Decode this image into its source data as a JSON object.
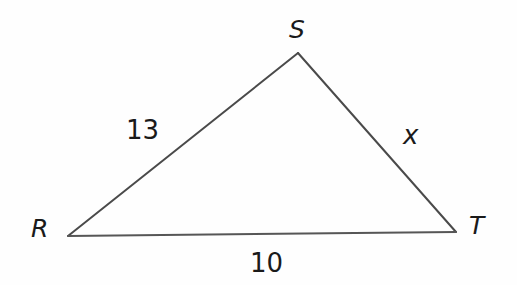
{
  "figure": {
    "kind": "geometry-diagram",
    "shape": "triangle",
    "name": "RST",
    "width": 517,
    "height": 285,
    "background_color": "#fefefe",
    "stroke_color": "#4a4a4a",
    "stroke_width": 2,
    "text_color": "#1a1a1a"
  },
  "vertices": [
    {
      "label": "R",
      "x": 68,
      "y": 236
    },
    {
      "label": "S",
      "x": 298,
      "y": 53
    },
    {
      "label": "T",
      "x": 456,
      "y": 232
    }
  ],
  "sides": [
    {
      "name": "RS",
      "label": "13",
      "from": "R",
      "to": "S",
      "known": true
    },
    {
      "name": "ST",
      "label": "x",
      "from": "S",
      "to": "T",
      "known": false
    },
    {
      "name": "RT",
      "label": "10",
      "from": "R",
      "to": "T",
      "known": true
    }
  ],
  "chart_data": {
    "type": "diagram",
    "title": "",
    "shape": "triangle",
    "vertex_labels": [
      "R",
      "S",
      "T"
    ],
    "vertex_points": [
      [
        68,
        236
      ],
      [
        298,
        53
      ],
      [
        456,
        232
      ]
    ],
    "side_labels": [
      "13",
      "x",
      "10"
    ],
    "side_label_positions": [
      [
        126,
        117
      ],
      [
        403,
        122
      ],
      [
        250,
        250
      ]
    ],
    "unknown": "x",
    "known_lengths": {
      "RS": 13,
      "RT": 10
    }
  }
}
